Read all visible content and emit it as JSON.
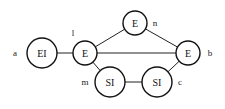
{
  "diagram": {
    "nodes": [
      {
        "id": "EI",
        "text": "EI",
        "label": "a",
        "cx": 42,
        "cy": 53,
        "r": 15,
        "lx": 15,
        "ly": 53
      },
      {
        "id": "E_l",
        "text": "E",
        "label": "l",
        "cx": 85,
        "cy": 53,
        "r": 12,
        "lx": 73,
        "ly": 33
      },
      {
        "id": "E_n",
        "text": "E",
        "label": "n",
        "cx": 135,
        "cy": 23,
        "r": 12,
        "lx": 155,
        "ly": 23
      },
      {
        "id": "E_b",
        "text": "E",
        "label": "b",
        "cx": 188,
        "cy": 53,
        "r": 12,
        "lx": 210,
        "ly": 53
      },
      {
        "id": "SI_m",
        "text": "SI",
        "label": "m",
        "cx": 110,
        "cy": 82,
        "r": 15,
        "lx": 85,
        "ly": 82
      },
      {
        "id": "SI_c",
        "text": "SI",
        "label": "c",
        "cx": 157,
        "cy": 82,
        "r": 15,
        "lx": 180,
        "ly": 82
      }
    ],
    "edges": [
      {
        "from": "EI",
        "to": "E_l"
      },
      {
        "from": "E_l",
        "to": "E_n"
      },
      {
        "from": "E_l",
        "to": "E_b"
      },
      {
        "from": "E_n",
        "to": "E_b"
      },
      {
        "from": "E_l",
        "to": "SI_m"
      },
      {
        "from": "SI_m",
        "to": "SI_c"
      },
      {
        "from": "SI_c",
        "to": "E_b"
      }
    ]
  }
}
